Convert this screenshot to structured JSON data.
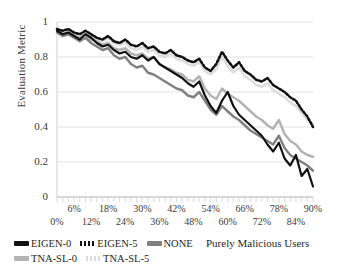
{
  "chart_data": {
    "type": "line",
    "title": "",
    "xlabel": "Purely Malicious Users",
    "ylabel": "Evaluation Metric",
    "xlim": [
      0,
      90
    ],
    "ylim": [
      0,
      1
    ],
    "grid": true,
    "grid_axis": "y",
    "legend_position": "bottom-left",
    "x_unit": "%",
    "x_tick_labels_upper": [
      "6%",
      "18%",
      "30%",
      "42%",
      "54%",
      "66%",
      "78%",
      "90%"
    ],
    "x_tick_labels_lower": [
      "0%",
      "12%",
      "24%",
      "36%",
      "48%",
      "60%",
      "72%",
      "84%"
    ],
    "y_tick_labels": [
      "0",
      "0.2",
      "0.4",
      "0.6",
      "0.8",
      "1"
    ],
    "y_ticks": [
      0,
      0.2,
      0.4,
      0.6,
      0.8,
      1
    ],
    "x": [
      0,
      2,
      4,
      6,
      8,
      10,
      12,
      14,
      16,
      18,
      20,
      22,
      24,
      26,
      28,
      30,
      32,
      34,
      36,
      38,
      40,
      42,
      44,
      46,
      48,
      50,
      52,
      54,
      56,
      58,
      60,
      62,
      64,
      66,
      68,
      70,
      72,
      74,
      76,
      78,
      80,
      82,
      84,
      86,
      88,
      90
    ],
    "series": [
      {
        "name": "EIGEN-0",
        "color": "#111111",
        "style": "solid",
        "width": 2.2,
        "values": [
          0.95,
          0.93,
          0.94,
          0.92,
          0.9,
          0.93,
          0.91,
          0.88,
          0.86,
          0.87,
          0.84,
          0.82,
          0.83,
          0.8,
          0.79,
          0.81,
          0.78,
          0.8,
          0.76,
          0.74,
          0.72,
          0.7,
          0.68,
          0.65,
          0.63,
          0.66,
          0.58,
          0.52,
          0.48,
          0.55,
          0.6,
          0.52,
          0.47,
          0.44,
          0.41,
          0.38,
          0.35,
          0.3,
          0.26,
          0.31,
          0.22,
          0.18,
          0.24,
          0.12,
          0.16,
          0.06
        ]
      },
      {
        "name": "EIGEN-5",
        "color": "#111111",
        "style": "dotted",
        "width": 2.6,
        "values": [
          0.96,
          0.95,
          0.96,
          0.94,
          0.93,
          0.95,
          0.93,
          0.91,
          0.9,
          0.92,
          0.89,
          0.88,
          0.9,
          0.87,
          0.86,
          0.88,
          0.85,
          0.86,
          0.83,
          0.82,
          0.84,
          0.81,
          0.8,
          0.78,
          0.77,
          0.79,
          0.74,
          0.72,
          0.76,
          0.83,
          0.78,
          0.74,
          0.77,
          0.72,
          0.7,
          0.67,
          0.66,
          0.68,
          0.64,
          0.62,
          0.6,
          0.57,
          0.55,
          0.5,
          0.46,
          0.4
        ]
      },
      {
        "name": "NONE",
        "color": "#808080",
        "style": "solid",
        "width": 2.4,
        "values": [
          0.94,
          0.92,
          0.93,
          0.91,
          0.89,
          0.91,
          0.88,
          0.86,
          0.84,
          0.85,
          0.81,
          0.79,
          0.8,
          0.76,
          0.74,
          0.75,
          0.71,
          0.7,
          0.68,
          0.66,
          0.64,
          0.62,
          0.61,
          0.58,
          0.57,
          0.6,
          0.55,
          0.5,
          0.47,
          0.52,
          0.49,
          0.46,
          0.44,
          0.41,
          0.38,
          0.36,
          0.34,
          0.32,
          0.3,
          0.35,
          0.28,
          0.24,
          0.22,
          0.2,
          0.18,
          0.15
        ]
      },
      {
        "name": "TNA-SL-0",
        "color": "#b3b3b3",
        "style": "solid",
        "width": 2.4,
        "values": [
          0.95,
          0.93,
          0.94,
          0.92,
          0.91,
          0.93,
          0.9,
          0.89,
          0.87,
          0.88,
          0.85,
          0.84,
          0.85,
          0.82,
          0.81,
          0.82,
          0.79,
          0.8,
          0.76,
          0.74,
          0.73,
          0.71,
          0.7,
          0.67,
          0.66,
          0.69,
          0.62,
          0.58,
          0.56,
          0.62,
          0.59,
          0.57,
          0.55,
          0.52,
          0.49,
          0.46,
          0.44,
          0.41,
          0.39,
          0.44,
          0.36,
          0.32,
          0.3,
          0.26,
          0.24,
          0.23
        ]
      },
      {
        "name": "TNA-SL-5",
        "color": "#dcdcdc",
        "style": "dotted",
        "width": 2.6,
        "values": [
          0.95,
          0.94,
          0.95,
          0.93,
          0.92,
          0.94,
          0.92,
          0.9,
          0.89,
          0.91,
          0.88,
          0.87,
          0.88,
          0.85,
          0.84,
          0.86,
          0.83,
          0.84,
          0.81,
          0.8,
          0.82,
          0.79,
          0.78,
          0.76,
          0.75,
          0.77,
          0.72,
          0.7,
          0.73,
          0.8,
          0.75,
          0.71,
          0.74,
          0.69,
          0.67,
          0.64,
          0.63,
          0.65,
          0.61,
          0.59,
          0.57,
          0.54,
          0.52,
          0.48,
          0.44,
          0.42
        ]
      }
    ]
  },
  "legend": {
    "items": [
      {
        "label": "EIGEN-0"
      },
      {
        "label": "EIGEN-5"
      },
      {
        "label": "NONE"
      },
      {
        "label": "TNA-SL-0"
      },
      {
        "label": "TNA-SL-5"
      }
    ]
  }
}
